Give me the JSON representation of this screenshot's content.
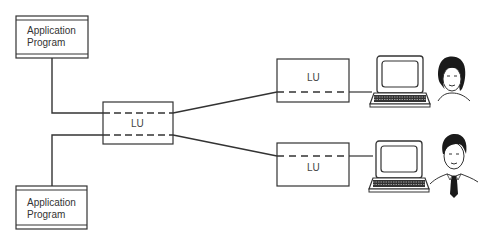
{
  "diagram": {
    "type": "network-topology",
    "colors": {
      "line": "#333333",
      "background": "#ffffff",
      "text": "#333333"
    },
    "nodes": {
      "app_top": {
        "label_line1": "Application",
        "label_line2": "Program"
      },
      "app_bottom": {
        "label_line1": "Application",
        "label_line2": "Program"
      },
      "lu_center": {
        "label": "LU"
      },
      "lu_top_right": {
        "label": "LU"
      },
      "lu_bottom_right": {
        "label": "LU"
      },
      "terminal_top": {
        "icon": "computer-terminal-icon"
      },
      "terminal_bottom": {
        "icon": "computer-terminal-icon"
      },
      "user_top": {
        "icon": "woman-user-icon"
      },
      "user_bottom": {
        "icon": "man-user-icon"
      }
    },
    "edges": [
      {
        "from": "app_top",
        "to": "lu_center",
        "style": "solid"
      },
      {
        "from": "app_bottom",
        "to": "lu_center",
        "style": "solid"
      },
      {
        "from": "lu_center",
        "to": "lu_top_right",
        "style": "solid"
      },
      {
        "from": "lu_center",
        "to": "lu_bottom_right",
        "style": "solid"
      },
      {
        "from": "lu_top_right",
        "to": "terminal_top",
        "style": "solid"
      },
      {
        "from": "lu_bottom_right",
        "to": "terminal_bottom",
        "style": "solid"
      }
    ]
  }
}
